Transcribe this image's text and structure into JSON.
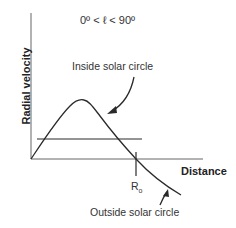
{
  "diagram": {
    "title": "0º <  ℓ  < 90º",
    "y_axis_label": "Radial velocity",
    "x_axis_label": "Distance",
    "tick_label": "R",
    "tick_label_sub": "o",
    "annotations": {
      "inside": "Inside solar circle",
      "outside": "Outside solar circle"
    },
    "colors": {
      "line": "#2a2a2a",
      "axis": "#555555",
      "background": "#ffffff"
    }
  }
}
